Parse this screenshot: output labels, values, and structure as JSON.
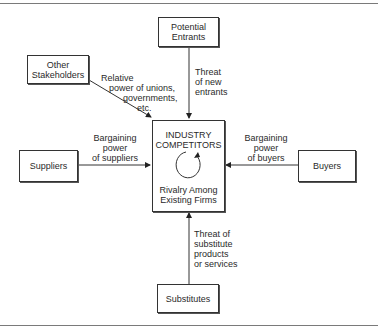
{
  "diagram": {
    "nodes": {
      "potential_entrants": "Potential\nEntrants",
      "other_stakeholders": "Other\nStakeholders",
      "suppliers": "Suppliers",
      "buyers": "Buyers",
      "substitutes": "Substitutes",
      "center": {
        "title_line1": "INDUSTRY",
        "title_line2": "COMPETITORS",
        "subtitle_line1": "Rivalry Among",
        "subtitle_line2": "Existing Firms"
      }
    },
    "edges": {
      "entrants": [
        "Threat",
        "of new",
        "entrants"
      ],
      "stakeholders": [
        "Relative",
        "power of unions,",
        "governments,",
        "etc."
      ],
      "suppliers": [
        "Bargaining",
        "power",
        "of suppliers"
      ],
      "buyers": [
        "Bargaining",
        "power",
        "of buyers"
      ],
      "substitutes": [
        "Threat of",
        "substitute",
        "products",
        "or services"
      ]
    },
    "colors": {
      "line": "#333333",
      "text": "#2a2a2a",
      "rule": "#7a7a7a"
    }
  }
}
